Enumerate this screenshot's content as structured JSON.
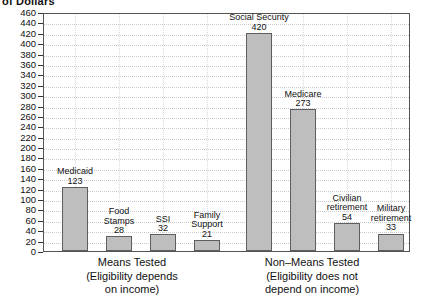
{
  "axis_title": "of Dollars",
  "chart_data": {
    "type": "bar",
    "title": "",
    "subtitle": "",
    "xlabel": "",
    "ylabel": "of Dollars",
    "ylim": [
      0,
      460
    ],
    "ytick_step": 20,
    "grid": true,
    "legend": "none",
    "yticks": [
      460,
      440,
      420,
      400,
      380,
      360,
      340,
      320,
      300,
      280,
      260,
      240,
      220,
      200,
      180,
      160,
      140,
      120,
      100,
      80,
      60,
      40,
      20,
      0
    ],
    "categories": [
      "Medicaid",
      "Food Stamps",
      "SSI",
      "Family Support",
      "Social Security",
      "Medicare",
      "Civilian retirement",
      "Military retirement"
    ],
    "values": [
      123,
      28,
      32,
      21,
      420,
      273,
      54,
      33
    ],
    "bars": [
      {
        "name": "Medicaid",
        "label_lines": [
          "Medicaid"
        ],
        "value": 123,
        "group": "means-tested"
      },
      {
        "name": "Food Stamps",
        "label_lines": [
          "Food",
          "Stamps"
        ],
        "value": 28,
        "group": "means-tested"
      },
      {
        "name": "SSI",
        "label_lines": [
          "SSI"
        ],
        "value": 32,
        "group": "means-tested"
      },
      {
        "name": "Family Support",
        "label_lines": [
          "Family",
          "Support"
        ],
        "value": 21,
        "group": "means-tested"
      },
      {
        "name": "Social Security",
        "label_lines": [
          "Social Security"
        ],
        "value": 420,
        "group": "non-means-tested"
      },
      {
        "name": "Medicare",
        "label_lines": [
          "Medicare"
        ],
        "value": 273,
        "group": "non-means-tested"
      },
      {
        "name": "Civilian retirement",
        "label_lines": [
          "Civilian",
          "retirement"
        ],
        "value": 54,
        "group": "non-means-tested"
      },
      {
        "name": "Military retirement",
        "label_lines": [
          "Military",
          "retirement"
        ],
        "value": 33,
        "group": "non-means-tested"
      }
    ],
    "groups": [
      {
        "id": "means-tested",
        "lines": [
          "Means Tested",
          "(Eligibility depends",
          "on income)"
        ]
      },
      {
        "id": "non-means-tested",
        "lines": [
          "Non–Means Tested",
          "(Eligibility does not",
          "depend on income)"
        ]
      }
    ],
    "colors": {
      "bar_fill": "#bebebe",
      "bar_stroke": "#5e5e5e",
      "gridline": "#c9c9cf",
      "axis": "#555555",
      "text": "#111111",
      "background": "#ffffff"
    }
  }
}
